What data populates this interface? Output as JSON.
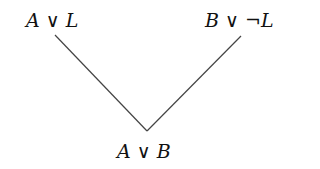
{
  "diagram": {
    "type": "resolution-inference",
    "premise_left": {
      "text": "A ∨ L",
      "parts": [
        "A",
        " ∨ ",
        "L"
      ]
    },
    "premise_right": {
      "text": "B ∨ ¬L",
      "parts": [
        "B",
        " ∨ ¬",
        "L"
      ]
    },
    "conclusion": {
      "text": "A ∨ B",
      "parts": [
        "A",
        " ∨ ",
        "B"
      ]
    },
    "edges": [
      {
        "from": "premise_left",
        "to": "conclusion"
      },
      {
        "from": "premise_right",
        "to": "conclusion"
      }
    ],
    "line_color": "#444444"
  }
}
